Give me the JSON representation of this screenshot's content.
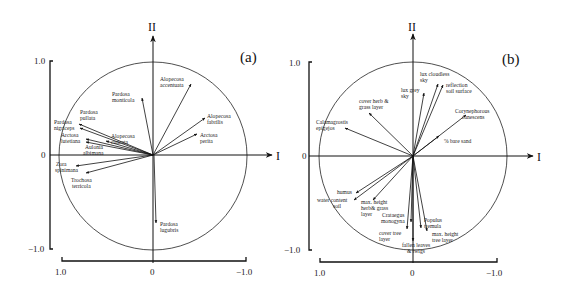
{
  "figure": {
    "panels": [
      {
        "id": "a",
        "label": "(a)",
        "axis_x_name": "I",
        "axis_y_name": "II",
        "y_ticks": [
          "1.0",
          "0",
          "−1.0"
        ],
        "x_ticks": [
          "1.0",
          "0",
          "−1.0"
        ],
        "vectors": [
          {
            "name": "Pardosa monticola",
            "line1": "Pardosa",
            "line2": "monticola",
            "tip": [
              142,
              98
            ]
          },
          {
            "name": "Alopecosa accentuata",
            "line1": "Alopecosa",
            "line2": "accentuata",
            "tip": [
              191,
              84
            ]
          },
          {
            "name": "Alopecosa fabrilis",
            "line1": "Alopecosa",
            "line2": "fabrilis",
            "tip": [
              205,
              118
            ]
          },
          {
            "name": "Arctosa perita",
            "line1": "Arctosa",
            "line2": "perita",
            "tip": [
              197,
              140
            ]
          },
          {
            "name": "Pardosa pullata",
            "line1": "Pardosa",
            "line2": "pullata",
            "tip": [
              79,
              124
            ]
          },
          {
            "name": "Pardosa nigriceps",
            "line1": "Pardosa",
            "line2": "nigriceps",
            "tip": [
              79,
              128
            ]
          },
          {
            "name": "Alopecosa cuneata",
            "line1": "Alopecosa",
            "line2": "cuneata",
            "tip": [
              106,
              141
            ]
          },
          {
            "name": "Arctosa lutetiana",
            "line1": "Arctosa",
            "line2": "lutetiana",
            "tip": [
              86,
              139
            ]
          },
          {
            "name": "Aulonia albimana",
            "line1": "Aulonia",
            "line2": "albimana",
            "tip": [
              86,
              142
            ]
          },
          {
            "name": "Zora spinimana",
            "line1": "Zora",
            "line2": "spinimana",
            "tip": [
              76,
              166
            ]
          },
          {
            "name": "Trochosa terricola",
            "line1": "Trochosa",
            "line2": "terricola",
            "tip": [
              86,
              173
            ]
          },
          {
            "name": "Pardosa lugubris",
            "line1": "Pardosa",
            "line2": "lugubris",
            "tip": [
              156,
              223
            ]
          }
        ]
      },
      {
        "id": "b",
        "label": "(b)",
        "axis_x_name": "I",
        "axis_y_name": "II",
        "y_ticks": [
          "1.0",
          "0",
          "−1.0"
        ],
        "x_ticks": [
          "1.0",
          "0",
          "−1.0"
        ],
        "vectors": [
          {
            "name": "lux cloudless sky",
            "line1": "lux cloudless",
            "line2": "sky",
            "tip": [
              438,
              84
            ]
          },
          {
            "name": "reflection soil surface",
            "line1": "reflection",
            "line2": "soil surface",
            "tip": [
              443,
              85
            ]
          },
          {
            "name": "lux grey sky",
            "line1": "lux grey",
            "line2": "sky",
            "tip": [
              424,
              93
            ]
          },
          {
            "name": "Corynephorous canescens",
            "line1": "Corynephorous",
            "line2": "canescens",
            "tip": [
              466,
              115
            ]
          },
          {
            "name": "% bare sand",
            "line1": "% bare sand",
            "line2": "",
            "tip": [
              439,
              136
            ]
          },
          {
            "name": "cover herb & grass layer",
            "line1": "cover herb &",
            "line2": "grass layer",
            "tip": [
              369,
              113
            ]
          },
          {
            "name": "Calamagrostis epigejos",
            "line1": "Calamagrostis",
            "line2": "epigejos",
            "tip": [
              345,
              128
            ]
          },
          {
            "name": "humus",
            "line1": "humus",
            "line2": "",
            "tip": [
              356,
              193
            ]
          },
          {
            "name": "water content soil",
            "line1": "water content",
            "line2": "soil",
            "tip": [
              354,
              200
            ]
          },
          {
            "name": "max. height herb & grass layer",
            "line1": "max. height",
            "line2": "herb& grass",
            "line3": "layer",
            "tip": [
              373,
              200
            ]
          },
          {
            "name": "Crataegus monogyna",
            "line1": "Crataegus",
            "line2": "monogyna",
            "tip": [
              411,
              222
            ]
          },
          {
            "name": "cover tree layer",
            "line1": "cover tree",
            "line2": "layer",
            "tip": [
              407,
              229
            ]
          },
          {
            "name": "fallen leaves & twigs",
            "line1": "fallen leaves",
            "line2": "& twigs",
            "tip": [
              413,
              241
            ]
          },
          {
            "name": "Populus tremula",
            "line1": "Populus",
            "line2": "tremula",
            "tip": [
              421,
              228
            ]
          },
          {
            "name": "max. height tree layer",
            "line1": "max. height",
            "line2": "tree layer",
            "tip": [
              427,
              231
            ]
          }
        ]
      }
    ]
  }
}
